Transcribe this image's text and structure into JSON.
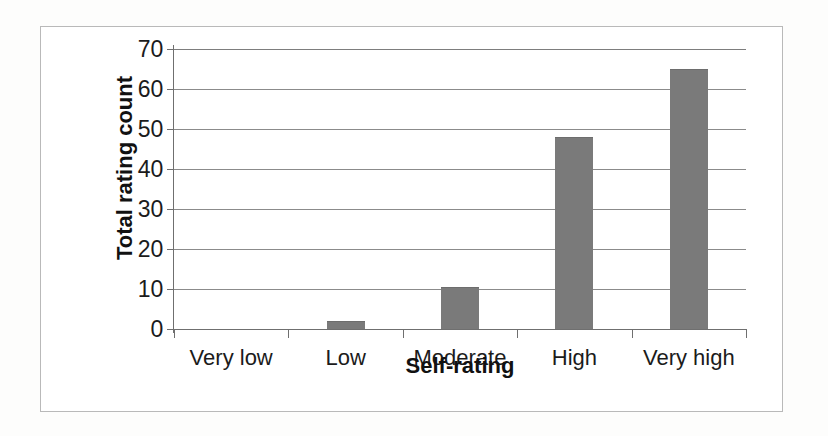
{
  "chart_data": {
    "type": "bar",
    "title": "",
    "xlabel": "Self-rating",
    "ylabel": "Total rating count",
    "categories": [
      "Very low",
      "Low",
      "Moderate",
      "High",
      "Very high"
    ],
    "values": [
      0,
      2,
      10.5,
      48,
      65
    ],
    "ylim": [
      0,
      70
    ],
    "yticks": [
      0,
      10,
      20,
      30,
      40,
      50,
      60,
      70
    ],
    "ytick_labels": [
      "0",
      "10",
      "20",
      "30",
      "40",
      "50",
      "60",
      "70"
    ],
    "grid": "horizontal",
    "legend": "none",
    "series": [
      {
        "name": "Total rating count",
        "values": [
          0,
          2,
          10.5,
          48,
          65
        ],
        "color": "#7a7a7a"
      }
    ],
    "colors": {
      "bar_fill": "#7a7a7a",
      "gridline": "#8b8b8b",
      "axis": "#6f6f6f",
      "frame": "#b9b9b9",
      "text": "#1b1b1b",
      "background": "#ffffff"
    }
  }
}
